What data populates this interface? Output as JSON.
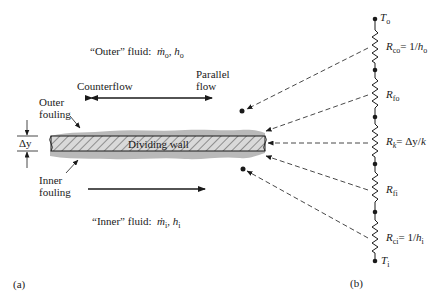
{
  "panel_a": {
    "label": "(a)",
    "outer_fluid": {
      "prefix": "“Outer” fluid:",
      "mdot": "ṁ",
      "mdot_sub": "o",
      "h": "h",
      "h_sub": "o"
    },
    "inner_fluid": {
      "prefix": "“Inner” fluid:",
      "mdot": "ṁ",
      "mdot_sub": "i",
      "h": "h",
      "h_sub": "i"
    },
    "counterflow": "Counterflow",
    "parallel_flow_line1": "Parallel",
    "parallel_flow_line2": "flow",
    "outer_fouling_line1": "Outer",
    "outer_fouling_line2": "fouling",
    "inner_fouling_line1": "Inner",
    "inner_fouling_line2": "fouling",
    "delta_y": "Δy",
    "dividing_wall": "Dividing wall"
  },
  "panel_b": {
    "label": "(b)",
    "t_outer": {
      "sym": "T",
      "sub": "o"
    },
    "t_inner": {
      "sym": "T",
      "sub": "i"
    },
    "resistors": [
      {
        "sym": "R",
        "sub": "co",
        "eq": "= 1/",
        "h": "h",
        "h_sub": "o"
      },
      {
        "sym": "R",
        "sub": "fo"
      },
      {
        "sym": "R",
        "sub": "k",
        "eq": "= Δy/",
        "k": "k"
      },
      {
        "sym": "R",
        "sub": "fi"
      },
      {
        "sym": "R",
        "sub": "ci",
        "eq": "= 1/",
        "h": "h",
        "h_sub": "i"
      }
    ]
  },
  "colors": {
    "ink": "#1a1a1a",
    "fouling": "#b9b9b9",
    "wall_fill": "#d8d8d8",
    "hatch": "#7a7a7a"
  }
}
